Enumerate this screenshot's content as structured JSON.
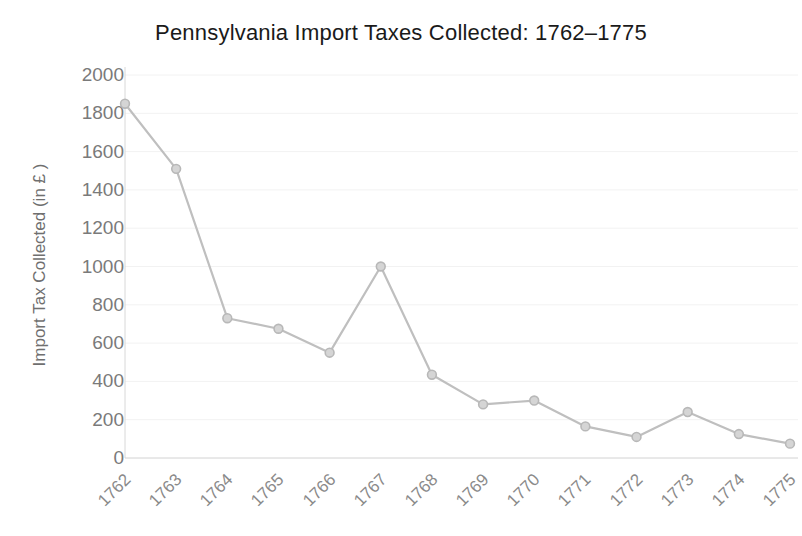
{
  "chart_data": {
    "type": "line",
    "title": "Pennsylvania Import Taxes Collected: 1762–1775",
    "xlabel": "",
    "ylabel": "Import Tax Collected (in £ )",
    "categories": [
      "1762",
      "1763",
      "1764",
      "1765",
      "1766",
      "1767",
      "1768",
      "1769",
      "1770",
      "1771",
      "1772",
      "1773",
      "1774",
      "1775"
    ],
    "values": [
      1850,
      1510,
      730,
      675,
      550,
      1000,
      435,
      280,
      300,
      165,
      110,
      240,
      125,
      75
    ],
    "series": [
      {
        "name": "Import Tax Collected",
        "values": [
          1850,
          1510,
          730,
          675,
          550,
          1000,
          435,
          280,
          300,
          165,
          110,
          240,
          125,
          75
        ]
      }
    ],
    "ylim": [
      0,
      2000
    ],
    "ytick_values": [
      0,
      200,
      400,
      600,
      800,
      1000,
      1200,
      1400,
      1600,
      1800,
      2000
    ],
    "ytick_labels": [
      "0",
      "200",
      "400",
      "600",
      "800",
      "1000",
      "1200",
      "1400",
      "1600",
      "1800",
      "2000"
    ],
    "grid": true,
    "grid_axis": "y",
    "legend": false,
    "legend_position": "none",
    "marker": "circle",
    "xtick_rotation": -45,
    "colors": {
      "line": "#bfbfbf",
      "marker_fill": "#d5d5d5",
      "marker_edge": "#b8b8b8",
      "grid": "#f2f2f2",
      "axis": "#d8d8d8",
      "title_text": "#1a1a1a",
      "tick_text": "#7a7a7a",
      "axis_label_text": "#6f6f6f",
      "background": "#ffffff"
    }
  }
}
